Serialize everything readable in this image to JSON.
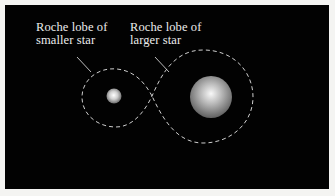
{
  "figure": {
    "labels": {
      "smaller_star_lobe": [
        "Roche lobe of",
        "smaller star"
      ],
      "larger_star_lobe": [
        "Roche lobe of",
        "larger star"
      ]
    },
    "elements": [
      {
        "name": "smaller-star",
        "shape": "sphere",
        "color": "#d8d8d8"
      },
      {
        "name": "larger-star",
        "shape": "sphere",
        "color": "#c8c8c8"
      },
      {
        "name": "roche-lobe-outline",
        "shape": "figure-eight",
        "style": "dashed",
        "color": "#cfcfcf"
      }
    ],
    "colors": {
      "background": "#020202",
      "frame": "#f4f4f2",
      "text": "#ececec",
      "lobe_line": "#cfcfcf"
    }
  }
}
